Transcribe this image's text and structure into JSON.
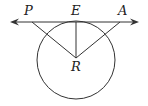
{
  "diagram": {
    "type": "geometry",
    "colors": {
      "stroke": "#333333",
      "label": "#222222",
      "background": "#ffffff"
    },
    "circle": {
      "center_label": "R",
      "cx": 76,
      "cy": 60,
      "r": 39
    },
    "line": {
      "y": 22,
      "x1": 12,
      "x2": 137,
      "arrows": "both"
    },
    "points": {
      "P": {
        "label": "P",
        "x": 32,
        "y": 22
      },
      "E": {
        "label": "E",
        "x": 76,
        "y": 22
      },
      "A": {
        "label": "A",
        "x": 120,
        "y": 22
      },
      "R": {
        "label": "R",
        "x": 76,
        "y": 58
      }
    },
    "segments": [
      "RP",
      "RE",
      "RA"
    ]
  }
}
